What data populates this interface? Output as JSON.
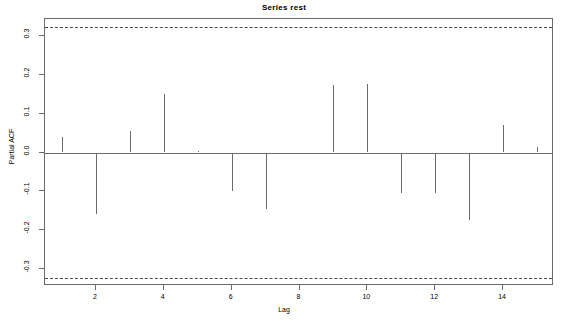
{
  "chart_data": {
    "type": "bar",
    "title": "Series  rest",
    "xlabel": "Lag",
    "ylabel": "Partial ACF",
    "categories": [
      1,
      2,
      3,
      4,
      5,
      6,
      7,
      8,
      9,
      10,
      11,
      12,
      13,
      14,
      15
    ],
    "values": [
      0.04,
      -0.16,
      0.055,
      0.152,
      0.004,
      -0.1,
      -0.146,
      0.0,
      0.175,
      0.178,
      -0.105,
      -0.105,
      -0.175,
      0.072,
      0.015
    ],
    "xlim": [
      0.5,
      15.5
    ],
    "ylim": [
      -0.345,
      0.345
    ],
    "xticks": [
      2,
      4,
      6,
      8,
      10,
      12,
      14
    ],
    "yticks": [
      -0.3,
      -0.2,
      -0.1,
      0.0,
      0.1,
      0.2,
      0.3
    ],
    "ytick_labels": [
      "-0.3",
      "-0.2",
      "-0.1",
      "0.0",
      "0.1",
      "0.2",
      "0.3"
    ],
    "xtick_labels": [
      "2",
      "4",
      "6",
      "8",
      "10",
      "12",
      "14"
    ],
    "confidence_bounds": [
      0.325,
      -0.325
    ],
    "confidence_style": "dashed",
    "grid": false,
    "legend": null,
    "line_color": "#6b6b6b",
    "conf_color": "#4a4a4a",
    "background": "#ffffff"
  }
}
